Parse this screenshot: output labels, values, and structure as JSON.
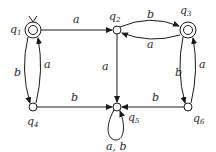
{
  "diagram": {
    "type": "finite-automaton",
    "states": [
      {
        "id": "q1",
        "name": "q",
        "sub": "1",
        "x": 33,
        "y": 30,
        "accepting": true,
        "initial": true,
        "lx": 10,
        "ly": 33
      },
      {
        "id": "q2",
        "name": "q",
        "sub": "2",
        "x": 117,
        "y": 30,
        "accepting": false,
        "initial": false,
        "lx": 109,
        "ly": 20
      },
      {
        "id": "q3",
        "name": "q",
        "sub": "3",
        "x": 188,
        "y": 30,
        "accepting": true,
        "initial": false,
        "lx": 180,
        "ly": 14
      },
      {
        "id": "q4",
        "name": "q",
        "sub": "4",
        "x": 33,
        "y": 107,
        "accepting": false,
        "initial": false,
        "lx": 27,
        "ly": 125
      },
      {
        "id": "q5",
        "name": "q",
        "sub": "5",
        "x": 117,
        "y": 107,
        "accepting": false,
        "initial": false,
        "lx": 128,
        "ly": 121
      },
      {
        "id": "q6",
        "name": "q",
        "sub": "6",
        "x": 188,
        "y": 107,
        "accepting": false,
        "initial": false,
        "lx": 193,
        "ly": 122
      }
    ],
    "transitions": [
      {
        "from": "q1",
        "to": "q2",
        "label": "a",
        "lx": 73,
        "ly": 23
      },
      {
        "from": "q2",
        "to": "q3",
        "label": "b",
        "lx": 150,
        "ly": 17
      },
      {
        "from": "q3",
        "to": "q2",
        "label": "a",
        "lx": 150,
        "ly": 46
      },
      {
        "from": "q1",
        "to": "q4",
        "label": "b",
        "lx": 17,
        "ly": 75
      },
      {
        "from": "q4",
        "to": "q1",
        "label": "a",
        "lx": 44,
        "ly": 66
      },
      {
        "from": "q2",
        "to": "q5",
        "label": "a",
        "lx": 103,
        "ly": 70
      },
      {
        "from": "q3",
        "to": "q6",
        "label": "b",
        "lx": 177,
        "ly": 74
      },
      {
        "from": "q6",
        "to": "q3",
        "label": "a",
        "lx": 199,
        "ly": 66
      },
      {
        "from": "q4",
        "to": "q5",
        "label": "b",
        "lx": 73,
        "ly": 100
      },
      {
        "from": "q6",
        "to": "q5",
        "label": "b",
        "lx": 154,
        "ly": 100
      },
      {
        "from": "q5",
        "to": "q5",
        "label": "a, b",
        "lx": 106,
        "ly": 148
      }
    ]
  },
  "colors": {
    "stroke": "#1a1a1a",
    "text": "#2a2a2a",
    "background": "#ffffff"
  }
}
